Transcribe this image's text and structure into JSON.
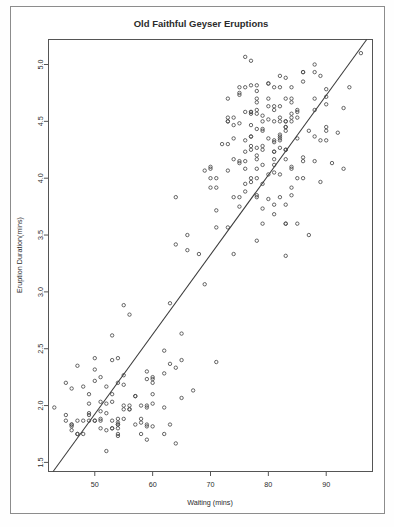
{
  "figure": {
    "title": "Old Faithful Geyser Eruptions",
    "background_color": "#ffffff",
    "frame_color": "#8c8c8c"
  },
  "chart_data": {
    "type": "scatter",
    "title": "Old Faithful Geyser Eruptions",
    "xlabel": "Waiting (mins)",
    "ylabel": "Eruption Duration(mins)",
    "xlim": [
      42.0,
      98.0
    ],
    "ylim": [
      1.42,
      5.22
    ],
    "xticks": [
      50,
      60,
      70,
      80,
      90
    ],
    "yticks": [
      1.5,
      2.0,
      2.5,
      3.0,
      3.5,
      4.0,
      4.5,
      5.0
    ],
    "xticklabels": [
      "50",
      "60",
      "70",
      "80",
      "90"
    ],
    "yticklabels": [
      "1.5",
      "2.0",
      "2.5",
      "3.0",
      "3.5",
      "4.0",
      "4.5",
      "5.0"
    ],
    "grid": false,
    "legend": null,
    "marker": "open-circle",
    "marker_color": "#4a4a4a",
    "marker_radius": 1.7,
    "trendline": {
      "type": "linear-fit",
      "color": "#3a3a3a",
      "x_start": 42.8,
      "y_start": 1.42,
      "x_end": 97.0,
      "y_end": 5.22
    },
    "x": [
      79,
      54,
      74,
      62,
      85,
      55,
      88,
      85,
      51,
      85,
      54,
      84,
      78,
      47,
      83,
      52,
      62,
      84,
      52,
      79,
      51,
      47,
      78,
      69,
      74,
      83,
      55,
      76,
      78,
      79,
      73,
      77,
      66,
      80,
      74,
      52,
      48,
      80,
      59,
      90,
      80,
      58,
      84,
      58,
      73,
      83,
      64,
      53,
      82,
      59,
      75,
      90,
      54,
      80,
      54,
      83,
      71,
      64,
      77,
      81,
      59,
      84,
      48,
      82,
      60,
      92,
      78,
      78,
      65,
      73,
      82,
      56,
      79,
      71,
      62,
      76,
      60,
      78,
      76,
      83,
      75,
      82,
      70,
      65,
      73,
      88,
      76,
      80,
      48,
      86,
      60,
      90,
      50,
      78,
      63,
      72,
      84,
      75,
      51,
      82,
      62,
      88,
      49,
      83,
      81,
      47,
      84,
      52,
      86,
      81,
      75,
      59,
      89,
      79,
      59,
      81,
      50,
      85,
      59,
      87,
      53,
      69,
      77,
      56,
      88,
      81,
      45,
      82,
      55,
      90,
      45,
      83,
      56,
      89,
      46,
      82,
      51,
      86,
      53,
      79,
      81,
      60,
      82,
      77,
      76,
      59,
      80,
      49,
      96,
      53,
      77,
      77,
      65,
      81,
      71,
      70,
      81,
      93,
      53,
      89,
      45,
      86,
      58,
      78,
      66,
      76,
      63,
      88,
      52,
      93,
      49,
      57,
      77,
      68,
      81,
      81,
      73,
      50,
      85,
      74,
      55,
      77,
      83,
      83,
      51,
      78,
      84,
      46,
      83,
      55,
      81,
      57,
      76,
      84,
      77,
      81,
      87,
      77,
      51,
      78,
      60,
      82,
      91,
      53,
      78,
      46,
      77,
      84,
      49,
      83,
      71,
      80,
      49,
      75,
      64,
      76,
      53,
      94,
      55,
      76,
      50,
      82,
      54,
      75,
      78,
      79,
      78,
      78,
      70,
      79,
      70,
      54,
      86,
      50,
      90,
      54,
      54,
      77,
      79,
      64,
      75,
      47,
      86,
      63,
      85,
      82,
      57,
      82,
      67,
      74,
      54,
      83,
      73,
      73,
      88,
      80,
      71,
      83,
      56,
      79,
      78,
      84,
      58,
      83,
      43,
      60,
      75,
      81,
      46,
      90,
      46,
      74
    ],
    "y": [
      3.6,
      1.8,
      3.333,
      2.283,
      4.533,
      2.883,
      4.7,
      3.6,
      1.95,
      4.35,
      1.833,
      3.917,
      4.2,
      1.75,
      4.7,
      2.167,
      1.75,
      4.8,
      1.6,
      4.25,
      1.8,
      1.75,
      3.45,
      3.067,
      4.533,
      3.6,
      1.967,
      4.083,
      3.85,
      4.433,
      4.3,
      4.467,
      3.367,
      4.033,
      3.833,
      2.017,
      1.867,
      4.833,
      1.833,
      4.783,
      4.35,
      1.883,
      4.567,
      1.75,
      4.533,
      3.317,
      3.833,
      2.1,
      4.633,
      2.0,
      4.8,
      4.716,
      1.833,
      4.833,
      1.733,
      4.883,
      3.717,
      1.667,
      4.567,
      4.317,
      2.233,
      4.5,
      1.75,
      4.8,
      1.817,
      4.4,
      4.167,
      4.7,
      2.067,
      4.7,
      4.033,
      1.967,
      4.5,
      4.0,
      1.983,
      5.067,
      2.017,
      4.567,
      3.883,
      3.6,
      4.133,
      4.333,
      4.1,
      2.633,
      4.067,
      4.933,
      3.95,
      4.517,
      2.167,
      4.0,
      2.2,
      4.333,
      1.867,
      4.817,
      1.833,
      4.3,
      4.667,
      3.75,
      1.867,
      4.9,
      2.483,
      4.367,
      2.1,
      4.5,
      4.05,
      1.867,
      4.7,
      1.783,
      4.85,
      3.683,
      4.733,
      2.3,
      4.9,
      4.417,
      1.7,
      4.633,
      2.317,
      4.6,
      1.817,
      4.417,
      2.617,
      4.067,
      4.25,
      1.967,
      4.6,
      3.767,
      1.917,
      4.5,
      2.267,
      4.65,
      1.867,
      4.167,
      2.8,
      4.333,
      1.833,
      4.383,
      1.883,
      4.933,
      2.033,
      3.733,
      4.233,
      2.233,
      4.533,
      4.817,
      4.333,
      1.983,
      4.633,
      2.017,
      5.1,
      1.8,
      5.033,
      4.0,
      2.4,
      4.6,
      3.567,
      4.0,
      4.5,
      4.083,
      1.8,
      3.967,
      2.2,
      4.15,
      2.0,
      3.833,
      3.5,
      4.583,
      2.367,
      5.0,
      1.933,
      4.617,
      1.917,
      2.083,
      4.583,
      3.333,
      4.167,
      4.333,
      4.5,
      2.417,
      4.0,
      4.167,
      1.883,
      4.583,
      4.25,
      3.767,
      2.033,
      4.433,
      4.083,
      1.833,
      4.417,
      2.183,
      4.8,
      1.833,
      4.8,
      4.1,
      3.966,
      4.233,
      3.5,
      4.366,
      2.25,
      4.667,
      2.1,
      4.35,
      4.133,
      1.867,
      4.6,
      1.783,
      4.367,
      3.85,
      1.933,
      4.5,
      2.383,
      4.7,
      1.867,
      3.833,
      3.417,
      4.233,
      2.4,
      4.8,
      2.0,
      4.15,
      1.867,
      4.267,
      1.75,
      4.483,
      4.0,
      4.117,
      4.083,
      4.267,
      3.917,
      4.55,
      4.083,
      2.417,
      4.183,
      2.217,
      4.45,
      1.883,
      1.85,
      4.283,
      3.95,
      2.333,
      4.15,
      2.35,
      4.933,
      2.9,
      4.583,
      3.833,
      2.083,
      4.367,
      2.133,
      4.35,
      2.2,
      4.45,
      3.567,
      4.5,
      4.15,
      3.817,
      3.917,
      4.45,
      2.0,
      4.283,
      4.767,
      4.533,
      1.85,
      4.25,
      1.983,
      2.25,
      4.75,
      4.117,
      2.15,
      4.417,
      1.817,
      4.467
    ],
    "n_points": 272
  },
  "axes": {
    "x_title": "Waiting (mins)",
    "y_title": "Eruption Duration(mins)"
  }
}
